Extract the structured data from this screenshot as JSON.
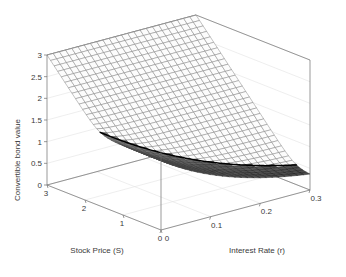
{
  "chart_data": {
    "type": "surface",
    "title": "",
    "xlabel": "Stock Price (S)",
    "ylabel": "Interest Rate (r)",
    "zlabel": "Convertible bond value",
    "xlim": [
      0,
      3
    ],
    "ylim": [
      0,
      0.3
    ],
    "zlim": [
      0,
      3
    ],
    "xticks": [
      "3",
      "2",
      "1",
      "0"
    ],
    "xtick_values": [
      3,
      2,
      1,
      0
    ],
    "yticks": [
      "0",
      "0.1",
      "0.2",
      "0.3"
    ],
    "ytick_values": [
      0,
      0.1,
      0.2,
      0.3
    ],
    "zticks": [
      "0",
      "0.5",
      "1",
      "1.5",
      "2",
      "2.5",
      "3"
    ],
    "ztick_values": [
      0,
      0.5,
      1,
      1.5,
      2,
      2.5,
      3
    ],
    "grid": true,
    "legend": "none",
    "shading": "grayscale-mesh",
    "mesh_nx": 33,
    "mesh_ny": 25,
    "view_azimuth": -37.5,
    "view_elevation": 24,
    "surface_description": "Convertible bond value surface: equals max(S, discounted face) - convex in S and decreasing in r; bold black curve marks the conversion boundary where the surface meets the S=max plane",
    "face_value": 1.6,
    "conversion_ratio": 1.0,
    "x_grid": [
      0,
      0.09375,
      0.1875,
      0.28125,
      0.375,
      0.46875,
      0.5625,
      0.65625,
      0.75,
      0.84375,
      0.9375,
      1.03125,
      1.125,
      1.21875,
      1.3125,
      1.40625,
      1.5,
      1.59375,
      1.6875,
      1.78125,
      1.875,
      1.96875,
      2.0625,
      2.15625,
      2.25,
      2.34375,
      2.4375,
      2.53125,
      2.625,
      2.71875,
      2.8125,
      2.90625,
      3
    ],
    "y_grid": [
      0,
      0.0125,
      0.025,
      0.0375,
      0.05,
      0.0625,
      0.075,
      0.0875,
      0.1,
      0.1125,
      0.125,
      0.1375,
      0.15,
      0.1625,
      0.175,
      0.1875,
      0.2,
      0.2125,
      0.225,
      0.2375,
      0.25,
      0.2625,
      0.275,
      0.2875,
      0.3
    ],
    "z_corner_values": {
      "S0_r0": 1.62,
      "S0_r030": 1.6,
      "S3_r0": 3.0,
      "S3_r030": 3.0,
      "min_value": 0.02,
      "min_at": "S=0.9, r=0.3"
    },
    "boundary_curve_note": "Bold black edge runs from (S=3, r=0, z=3) down to about (S=1.2, r=0.3, z=1.6)"
  },
  "axes": {
    "z_title": "Convertible bond value",
    "x_title": "Stock Price (S)",
    "y_title": "Interest Rate (r)"
  }
}
